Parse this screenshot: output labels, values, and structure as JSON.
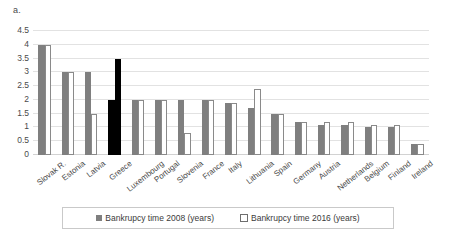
{
  "panel": {
    "label": "a."
  },
  "legend": {
    "items": [
      {
        "label": "Bankrupcy time 2008 (years)",
        "marker": "filled-square-icon",
        "color": "#7f7f7f"
      },
      {
        "label": "Bankrupcy time 2016 (years)",
        "marker": "hollow-square-icon",
        "color": "#ffffff"
      }
    ]
  },
  "chart_data": {
    "type": "bar",
    "title": "",
    "xlabel": "",
    "ylabel": "",
    "ylim": [
      0,
      4.5
    ],
    "yticks": [
      "0",
      "0.5",
      "1",
      "1.5",
      "2",
      "2.5",
      "3",
      "3.5",
      "4",
      "4.5"
    ],
    "grid": true,
    "legend_position": "bottom",
    "categories": [
      "Slovak R.",
      "Estonia",
      "Latvia",
      "Greece",
      "Luxembourg",
      "Portugal",
      "Slovenia",
      "France",
      "Italy",
      "Lithuania",
      "Spain",
      "Germany",
      "Austria",
      "Netherlands",
      "Belgium",
      "Finland",
      "Ireland"
    ],
    "series": [
      {
        "name": "Bankrupcy time 2008 (years)",
        "color": "#7f7f7f",
        "values": [
          4.0,
          3.0,
          3.0,
          2.0,
          2.0,
          2.0,
          2.0,
          2.0,
          1.9,
          1.7,
          1.5,
          1.2,
          1.1,
          1.1,
          1.0,
          1.0,
          0.4
        ]
      },
      {
        "name": "Bankrupcy time 2016 (years)",
        "color": "#ffffff",
        "values": [
          4.0,
          3.0,
          1.5,
          3.5,
          2.0,
          2.0,
          0.8,
          2.0,
          1.9,
          2.4,
          1.5,
          1.2,
          1.2,
          1.2,
          1.1,
          1.1,
          0.4
        ]
      }
    ],
    "highlighted_category": "Greece",
    "annotations": []
  }
}
